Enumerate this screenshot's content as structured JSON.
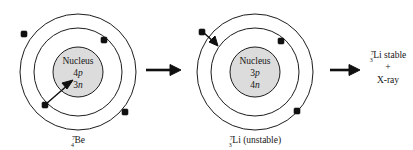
{
  "figure": {
    "background_color": "#ffffff",
    "stroke_color": "#1d1d1d",
    "nucleus_fill_color": "#dcdcdc",
    "electron_color": "#101010"
  },
  "atoms": [
    {
      "id": "beryllium-7",
      "nucleus": {
        "title": "Nucleus",
        "proton_count": "4",
        "proton_symbol": "p",
        "neutron_count": "3",
        "neutron_symbol": "n"
      },
      "caption": {
        "mass_number": "7",
        "atomic_number": "4",
        "element": "Be",
        "state": ""
      },
      "shell_count": 2,
      "electron_count": 4
    },
    {
      "id": "lithium-7-unstable",
      "nucleus": {
        "title": "Nucleus",
        "proton_count": "3",
        "proton_symbol": "p",
        "neutron_count": "4",
        "neutron_symbol": "n"
      },
      "caption": {
        "mass_number": "7",
        "atomic_number": "3",
        "element": "Li",
        "state": " (unstable)"
      },
      "shell_count": 2,
      "electron_count": 3
    }
  ],
  "product": {
    "line1": {
      "mass_number": "7",
      "atomic_number": "3",
      "element": "Li",
      "state": " stable"
    },
    "line2": "+",
    "line3": "X-ray"
  },
  "arrows": {
    "step1_label": "decay-arrow-1",
    "step2_label": "decay-arrow-2",
    "capture_label": "electron-capture-arrow"
  }
}
